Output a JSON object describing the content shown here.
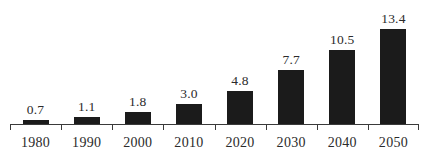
{
  "chart_data": {
    "type": "bar",
    "title": "",
    "subtitle": "",
    "xlabel": "",
    "ylabel": "",
    "categories": [
      "1980",
      "1990",
      "2000",
      "2010",
      "2020",
      "2030",
      "2040",
      "2050"
    ],
    "values": [
      0.7,
      1.1,
      1.8,
      3.0,
      4.8,
      7.7,
      10.5,
      13.4
    ],
    "value_labels": [
      "0.7",
      "1.1",
      "1.8",
      "3.0",
      "4.8",
      "7.7",
      "10.5",
      "13.4"
    ],
    "ylim": [
      0,
      13.4
    ],
    "grid": false,
    "legend": null,
    "legend_position": "none",
    "annotations": [],
    "axis": {
      "x_axis_visible": true,
      "y_axis_visible": false,
      "tick_direction": "down",
      "tick_positions": "category-boundaries"
    },
    "style": {
      "bar_color": "#1b1b1b",
      "background_color": "#ffffff",
      "text_color": "#2b2b2b",
      "axis_color": "#3a3a3a"
    }
  }
}
